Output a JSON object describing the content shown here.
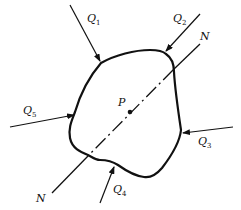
{
  "figure": {
    "colors": {
      "stroke": "#111111",
      "background": "#ffffff"
    }
  },
  "forces": [
    {
      "id": "Q1",
      "symbol": "Q",
      "subscript": "1"
    },
    {
      "id": "Q2",
      "symbol": "Q",
      "subscript": "2"
    },
    {
      "id": "Q3",
      "symbol": "Q",
      "subscript": "3"
    },
    {
      "id": "Q4",
      "symbol": "Q",
      "subscript": "4"
    },
    {
      "id": "Q5",
      "symbol": "Q",
      "subscript": "5"
    }
  ],
  "axis": {
    "label_top": "N",
    "label_bottom": "N"
  },
  "point": {
    "label": "P"
  }
}
